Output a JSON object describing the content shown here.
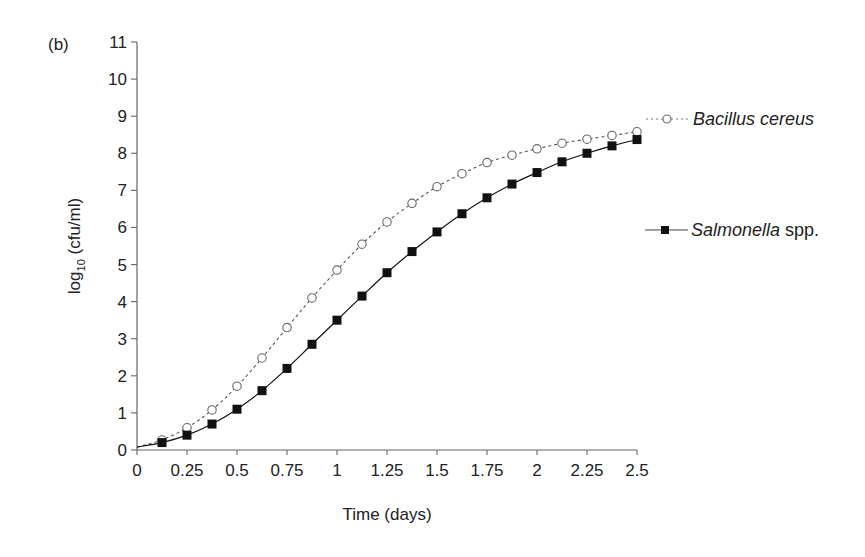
{
  "panel_label": "(b)",
  "chart_data": {
    "type": "line",
    "title": "",
    "xlabel": "Time (days)",
    "ylabel": "log10 (cfu/ml)",
    "ylabel_parts": {
      "main": "log",
      "sub": "10",
      "rest": " (cfu/ml)"
    },
    "xlim": [
      0,
      2.5
    ],
    "ylim": [
      0,
      11
    ],
    "grid": false,
    "legend_position": "right, inline labels at series ends",
    "x_ticks": [
      "0",
      "0.25",
      "0.5",
      "0.75",
      "1",
      "1.25",
      "1.5",
      "1.75",
      "2",
      "2.25",
      "2.5"
    ],
    "y_ticks": [
      "0",
      "1",
      "2",
      "3",
      "4",
      "5",
      "6",
      "7",
      "8",
      "9",
      "10",
      "11"
    ],
    "x": [
      0,
      0.125,
      0.25,
      0.375,
      0.5,
      0.625,
      0.75,
      0.875,
      1.0,
      1.125,
      1.25,
      1.375,
      1.5,
      1.625,
      1.75,
      1.875,
      2.0,
      2.125,
      2.25,
      2.375,
      2.5
    ],
    "series": [
      {
        "name": "Bacillus cereus",
        "marker": "open-circle",
        "line_style": "dotted",
        "color": "#555555",
        "values": [
          0.08,
          0.27,
          0.6,
          1.08,
          1.72,
          2.48,
          3.3,
          4.1,
          4.85,
          5.55,
          6.15,
          6.65,
          7.1,
          7.45,
          7.75,
          7.95,
          8.12,
          8.27,
          8.38,
          8.48,
          8.58
        ]
      },
      {
        "name": "Salmonella spp.",
        "marker": "filled-square",
        "line_style": "solid",
        "color": "#111111",
        "values": [
          0.08,
          0.2,
          0.4,
          0.7,
          1.1,
          1.6,
          2.2,
          2.85,
          3.5,
          4.15,
          4.78,
          5.35,
          5.88,
          6.37,
          6.8,
          7.17,
          7.48,
          7.77,
          8.0,
          8.2,
          8.37
        ]
      }
    ]
  },
  "legend": {
    "bacillus": {
      "italic": "Bacillus cereus",
      "plain": ""
    },
    "salmonella": {
      "italic": "Salmonella",
      "plain": " spp."
    }
  }
}
